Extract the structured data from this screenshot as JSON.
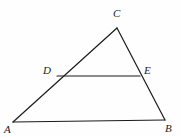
{
  "figure": {
    "canvas": {
      "width": 181,
      "height": 137
    },
    "background_color": "#fefefe",
    "stroke_color": "#1b1b1b",
    "stroke_width": 1.2,
    "label_color": "#1b1b1b",
    "label_font_size": 11,
    "label_style": "italic-serif",
    "points": {
      "A": {
        "x": 13,
        "y": 122
      },
      "B": {
        "x": 165,
        "y": 120
      },
      "C": {
        "x": 117,
        "y": 28
      },
      "D": {
        "x": 57,
        "y": 76
      },
      "E": {
        "x": 140,
        "y": 76
      }
    },
    "segments": [
      {
        "name": "AB",
        "from": "A",
        "to": "B"
      },
      {
        "name": "AC",
        "from": "A",
        "to": "C"
      },
      {
        "name": "CB",
        "from": "C",
        "to": "B"
      },
      {
        "name": "DE",
        "from": "D",
        "to": "E"
      }
    ],
    "labels": [
      {
        "id": "A",
        "text": "A",
        "x": 4,
        "y": 124
      },
      {
        "id": "B",
        "text": "B",
        "x": 165,
        "y": 123
      },
      {
        "id": "C",
        "text": "C",
        "x": 113,
        "y": 8
      },
      {
        "id": "D",
        "text": "D",
        "x": 43,
        "y": 65
      },
      {
        "id": "E",
        "text": "E",
        "x": 144,
        "y": 65
      }
    ]
  }
}
